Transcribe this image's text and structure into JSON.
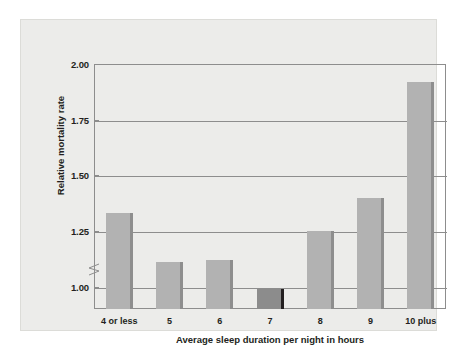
{
  "chart_data": {
    "type": "bar",
    "title": "",
    "subtitle": "",
    "xlabel": "Average sleep duration per night in hours",
    "ylabel": "Relative mortality rate",
    "categories": [
      "4 or less",
      "5",
      "6",
      "7",
      "8",
      "9",
      "10 plus"
    ],
    "values": [
      1.33,
      1.11,
      1.12,
      0.99,
      1.25,
      1.4,
      1.92
    ],
    "ylim": [
      0.9,
      2.0
    ],
    "y_ticks": [
      "1.00",
      "1.25",
      "1.50",
      "1.75",
      "2.00"
    ],
    "y_tick_values": [
      1.0,
      1.25,
      1.5,
      1.75,
      2.0
    ],
    "grid": "horizontal",
    "legend": "none",
    "axis_break": "y-axis broken below 1.00",
    "highlight_category": "7",
    "highlight_note": "reference bar at relative mortality rate 1.00",
    "colors": {
      "bar": "#b2b2b2",
      "bar_edge": "#8e8e8e",
      "bar_highlight": "#8c8c8c",
      "bar_highlight_edge": "#231f20",
      "panel_background": "#ececea",
      "axis": "#8d8d8d",
      "text": "#231f20",
      "page_background": "#ffffff"
    }
  }
}
